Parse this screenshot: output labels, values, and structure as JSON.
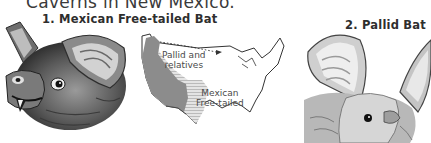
{
  "page": {
    "heading": "Caverns in New Mexico."
  },
  "figures": [
    {
      "number": "1.",
      "caption": "Mexican Free-tailed Bat",
      "illustration": "mexican-free-tailed-bat-head"
    },
    {
      "number": "2.",
      "caption": "Pallid Bat",
      "illustration": "pallid-bat-head"
    }
  ],
  "map": {
    "subject": "United States range map",
    "regions": [
      {
        "label_line1": "Pallid and",
        "label_line2": "relatives",
        "shade": "#8c8c8c"
      },
      {
        "label_line1": "Mexican",
        "label_line2": "Free-tailed",
        "shade": "#c8c8c8"
      }
    ]
  },
  "colors": {
    "ink": "#2e2e2e",
    "dark_range": "#8c8c8c",
    "light_range": "#c8c8c8",
    "paper": "#ffffff"
  }
}
